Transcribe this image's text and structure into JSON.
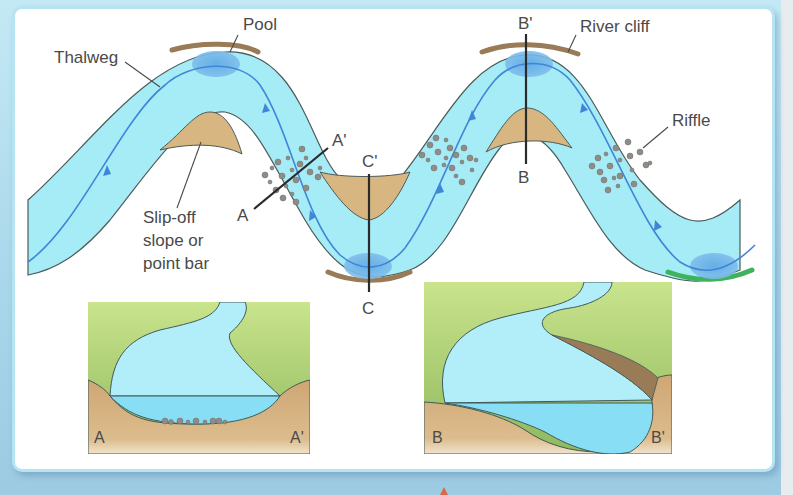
{
  "diagram": {
    "labels": {
      "thalweg": "Thalweg",
      "pool": "Pool",
      "river_cliff": "River cliff",
      "riffle": "Riffle",
      "slip_off_line1": "Slip-off",
      "slip_off_line2": "slope or",
      "slip_off_line3": "point bar"
    },
    "sections": {
      "a_start": "A",
      "a_end": "A'",
      "b_start": "B",
      "b_end": "B'",
      "c_start": "C",
      "c_end": "C'"
    },
    "insets": [
      {
        "id": "inset-a",
        "left_label": "A",
        "right_label": "A'"
      },
      {
        "id": "inset-b",
        "left_label": "B",
        "right_label": "B'"
      }
    ],
    "colors": {
      "water": "#a6ecf7",
      "thalweg": "#3f86d8",
      "pool": "#6eb2e6",
      "cliff": "#9a7b57",
      "point_bar": "#d8b681",
      "riffle": "#8f8c86",
      "vegetation": "#98c266",
      "soil": "#d1ae7e",
      "green_bank": "#3fb25e"
    }
  }
}
